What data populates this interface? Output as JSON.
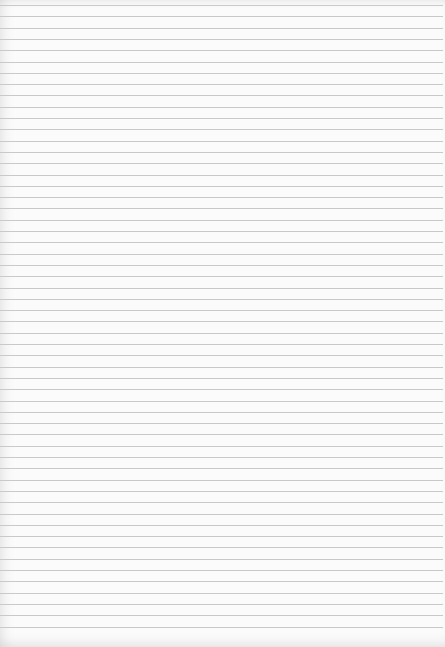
{
  "image": {
    "subject": "blank lined paper",
    "background_color": "#fbfbfb",
    "line_color": "#c9c9c9",
    "line_count": 56,
    "first_line_y": 5,
    "line_spacing_px": 11.3
  }
}
